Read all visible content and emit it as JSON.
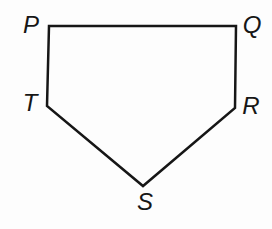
{
  "figure": {
    "background_color": "#fdfdfd",
    "stroke_color": "#161616",
    "stroke_width": 2.5,
    "canvas": {
      "width": 272,
      "height": 229
    },
    "shape": {
      "type": "polygon",
      "vertex_order": [
        "P",
        "Q",
        "R",
        "S",
        "T"
      ]
    },
    "vertices": [
      {
        "name": "P",
        "x": 49,
        "y": 26,
        "label": "P",
        "label_x": 31,
        "label_y": 33
      },
      {
        "name": "Q",
        "x": 236,
        "y": 26,
        "label": "Q",
        "label_x": 252,
        "label_y": 33
      },
      {
        "name": "R",
        "x": 235,
        "y": 108,
        "label": "R",
        "label_x": 251,
        "label_y": 114
      },
      {
        "name": "S",
        "x": 143,
        "y": 186,
        "label": "S",
        "label_x": 145,
        "label_y": 210
      },
      {
        "name": "T",
        "x": 47,
        "y": 106,
        "label": "T",
        "label_x": 30,
        "label_y": 111
      }
    ]
  }
}
